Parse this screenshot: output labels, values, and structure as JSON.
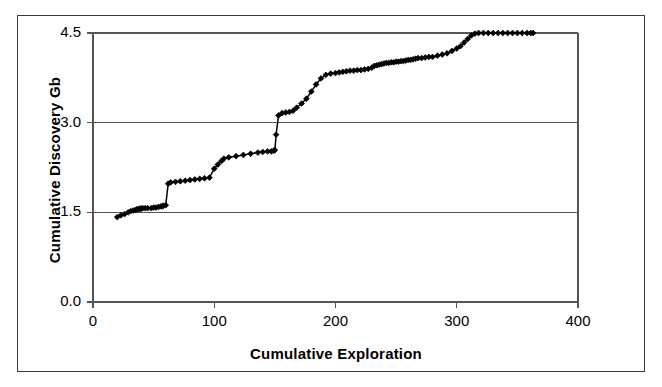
{
  "figure": {
    "frame_color": "#3b3b3b",
    "background": "#ffffff"
  },
  "chart_data": {
    "type": "line",
    "title": "",
    "subtitle": "",
    "xlabel": "Cumulative Exploration",
    "ylabel": "Cumulative Discovery Gb",
    "xlim": [
      0,
      400
    ],
    "ylim": [
      0.0,
      4.5
    ],
    "xticks": [
      0,
      100,
      200,
      300,
      400
    ],
    "xticklabels": [
      "0",
      "100",
      "200",
      "300",
      "400"
    ],
    "yticks": [
      0.0,
      1.5,
      3.0,
      4.5
    ],
    "yticklabels": [
      "0.0",
      "1.5",
      "3.0",
      "4.5"
    ],
    "grid": "horizontal-gridlines-at-yticks",
    "legend": "none",
    "marker": "filled-diamond",
    "marker_color": "#000000",
    "line_color": "#000000",
    "series": [
      {
        "name": "Cumulative Discovery",
        "x": [
          20,
          23,
          26,
          29,
          31,
          33,
          35,
          36,
          37,
          38,
          39,
          40,
          41,
          43,
          45,
          48,
          50,
          52,
          54,
          56,
          57,
          58,
          60,
          62,
          64,
          68,
          72,
          76,
          80,
          84,
          88,
          92,
          96,
          100,
          103,
          106,
          108,
          112,
          118,
          124,
          130,
          136,
          140,
          144,
          147,
          149,
          150,
          151,
          153,
          156,
          159,
          162,
          165,
          168,
          172,
          176,
          180,
          184,
          188,
          192,
          196,
          200,
          203,
          206,
          209,
          212,
          215,
          218,
          221,
          224,
          227,
          230,
          232,
          234,
          236,
          238,
          240,
          242,
          244,
          246,
          248,
          250,
          252,
          254,
          256,
          258,
          260,
          262,
          264,
          266,
          268,
          271,
          274,
          277,
          280,
          284,
          288,
          292,
          296,
          300,
          303,
          306,
          309,
          312,
          315,
          318,
          322,
          326,
          330,
          334,
          338,
          342,
          346,
          350,
          354,
          358,
          361,
          363
        ],
        "y": [
          1.42,
          1.45,
          1.47,
          1.5,
          1.52,
          1.53,
          1.54,
          1.55,
          1.55,
          1.56,
          1.56,
          1.56,
          1.57,
          1.57,
          1.57,
          1.57,
          1.58,
          1.58,
          1.59,
          1.6,
          1.6,
          1.61,
          1.62,
          1.98,
          2.0,
          2.01,
          2.02,
          2.03,
          2.04,
          2.05,
          2.06,
          2.07,
          2.08,
          2.23,
          2.3,
          2.36,
          2.4,
          2.42,
          2.44,
          2.46,
          2.48,
          2.5,
          2.51,
          2.52,
          2.52,
          2.53,
          2.54,
          2.8,
          3.12,
          3.16,
          3.17,
          3.18,
          3.2,
          3.25,
          3.32,
          3.4,
          3.52,
          3.64,
          3.74,
          3.8,
          3.82,
          3.83,
          3.84,
          3.85,
          3.86,
          3.87,
          3.87,
          3.88,
          3.88,
          3.89,
          3.9,
          3.92,
          3.95,
          3.96,
          3.97,
          3.98,
          3.99,
          4.0,
          4.0,
          4.01,
          4.01,
          4.02,
          4.02,
          4.03,
          4.03,
          4.04,
          4.05,
          4.05,
          4.06,
          4.07,
          4.08,
          4.08,
          4.09,
          4.1,
          4.1,
          4.12,
          4.14,
          4.16,
          4.2,
          4.24,
          4.28,
          4.34,
          4.4,
          4.46,
          4.49,
          4.5,
          4.5,
          4.5,
          4.5,
          4.5,
          4.5,
          4.5,
          4.5,
          4.5,
          4.5,
          4.5,
          4.5,
          4.5
        ]
      }
    ]
  }
}
